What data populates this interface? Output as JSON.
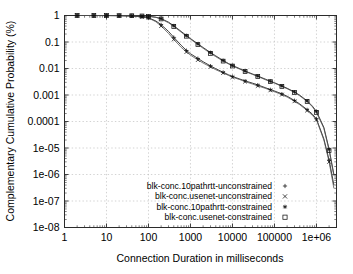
{
  "chart_data": {
    "type": "line",
    "title": "",
    "xlabel": "Connection Duration in milliseconds",
    "ylabel": "Complementary Cumulative Probability (%)",
    "xscale": "log",
    "yscale": "log",
    "xlim": [
      1,
      3000000
    ],
    "ylim": [
      1e-08,
      1
    ],
    "grid": true,
    "xticks": [
      1,
      10,
      100,
      1000,
      10000,
      100000,
      1000000
    ],
    "xticklabels": [
      "1",
      "10",
      "100",
      "1000",
      "10000",
      "100000",
      "1e+06"
    ],
    "yticks": [
      1,
      0.1,
      0.01,
      0.001,
      0.0001,
      1e-05,
      1e-06,
      1e-07,
      1e-08
    ],
    "yticklabels": [
      "1",
      "0.1",
      "0.01",
      "0.001",
      "0.0001",
      "1e-05",
      "1e-06",
      "1e-07",
      "1e-08"
    ],
    "legend_position": "lower center",
    "series": [
      {
        "name": "blk-conc.10pathrtt-unconstrained",
        "marker": "plus",
        "points": [
          [
            2,
            1
          ],
          [
            5,
            1
          ],
          [
            10,
            0.995
          ],
          [
            20,
            0.985
          ],
          [
            40,
            0.96
          ],
          [
            70,
            0.9
          ],
          [
            100,
            0.82
          ],
          [
            150,
            0.62
          ],
          [
            200,
            0.45
          ],
          [
            300,
            0.25
          ],
          [
            400,
            0.15
          ],
          [
            600,
            0.075
          ],
          [
            800,
            0.048
          ],
          [
            1000,
            0.036
          ],
          [
            1500,
            0.024
          ],
          [
            2000,
            0.018
          ],
          [
            3000,
            0.0125
          ],
          [
            4000,
            0.0098
          ],
          [
            6000,
            0.0072
          ],
          [
            8000,
            0.0058
          ],
          [
            10000,
            0.005
          ],
          [
            15000,
            0.004
          ],
          [
            20000,
            0.0034
          ],
          [
            30000,
            0.0028
          ],
          [
            40000,
            0.0024
          ],
          [
            60000,
            0.0019
          ],
          [
            80000,
            0.0016
          ],
          [
            100000,
            0.00142
          ],
          [
            150000,
            0.0011
          ],
          [
            200000,
            0.0009
          ],
          [
            300000,
            0.00062
          ],
          [
            400000,
            0.00046
          ],
          [
            600000,
            0.00028
          ],
          [
            800000,
            0.00019
          ],
          [
            1000000,
            0.000125
          ],
          [
            1500000,
            2.2e-05
          ],
          [
            2000000,
            3.5e-06
          ],
          [
            2600000,
            4e-07
          ]
        ]
      },
      {
        "name": "blk-conc.usenet-unconstrained",
        "marker": "cross",
        "points": [
          [
            2,
            1
          ],
          [
            5,
            1
          ],
          [
            10,
            0.995
          ],
          [
            20,
            0.985
          ],
          [
            40,
            0.955
          ],
          [
            70,
            0.885
          ],
          [
            100,
            0.8
          ],
          [
            150,
            0.58
          ],
          [
            200,
            0.4
          ],
          [
            300,
            0.21
          ],
          [
            400,
            0.125
          ],
          [
            600,
            0.063
          ],
          [
            800,
            0.042
          ],
          [
            1000,
            0.032
          ],
          [
            1500,
            0.021
          ],
          [
            2000,
            0.016
          ],
          [
            3000,
            0.0115
          ],
          [
            4000,
            0.009
          ],
          [
            6000,
            0.0068
          ],
          [
            8000,
            0.0055
          ],
          [
            10000,
            0.0047
          ],
          [
            15000,
            0.0038
          ],
          [
            20000,
            0.0032
          ],
          [
            30000,
            0.0026
          ],
          [
            40000,
            0.0022
          ],
          [
            60000,
            0.0018
          ],
          [
            80000,
            0.0015
          ],
          [
            100000,
            0.00133
          ],
          [
            150000,
            0.00103
          ],
          [
            200000,
            0.00084
          ],
          [
            300000,
            0.00058
          ],
          [
            400000,
            0.00043
          ],
          [
            600000,
            0.00026
          ],
          [
            800000,
            0.00017
          ],
          [
            1000000,
            0.000115
          ],
          [
            1500000,
            2e-05
          ],
          [
            2000000,
            3e-06
          ],
          [
            2600000,
            3e-07
          ]
        ]
      },
      {
        "name": "blk-conc.10pathrtt-constrained",
        "marker": "star",
        "points": [
          [
            2,
            1
          ],
          [
            5,
            1
          ],
          [
            10,
            0.998
          ],
          [
            20,
            0.993
          ],
          [
            40,
            0.985
          ],
          [
            70,
            0.965
          ],
          [
            100,
            0.94
          ],
          [
            150,
            0.86
          ],
          [
            200,
            0.76
          ],
          [
            300,
            0.56
          ],
          [
            400,
            0.41
          ],
          [
            600,
            0.25
          ],
          [
            800,
            0.175
          ],
          [
            1000,
            0.135
          ],
          [
            1500,
            0.085
          ],
          [
            2000,
            0.062
          ],
          [
            3000,
            0.04
          ],
          [
            4000,
            0.03
          ],
          [
            6000,
            0.02
          ],
          [
            8000,
            0.0155
          ],
          [
            10000,
            0.013
          ],
          [
            15000,
            0.0098
          ],
          [
            20000,
            0.008
          ],
          [
            30000,
            0.0062
          ],
          [
            40000,
            0.0052
          ],
          [
            60000,
            0.004
          ],
          [
            80000,
            0.0033
          ],
          [
            100000,
            0.0029
          ],
          [
            150000,
            0.0022
          ],
          [
            200000,
            0.0018
          ],
          [
            300000,
            0.0013
          ],
          [
            400000,
            0.00098
          ],
          [
            600000,
            0.0006
          ],
          [
            800000,
            0.00038
          ],
          [
            1000000,
            0.00024
          ],
          [
            1500000,
            6e-05
          ],
          [
            2000000,
            9e-06
          ],
          [
            2600000,
            1e-06
          ]
        ]
      },
      {
        "name": "blk-conc.usenet-constrained",
        "marker": "square",
        "points": [
          [
            2,
            1
          ],
          [
            5,
            1
          ],
          [
            10,
            0.998
          ],
          [
            20,
            0.992
          ],
          [
            40,
            0.983
          ],
          [
            70,
            0.962
          ],
          [
            100,
            0.935
          ],
          [
            150,
            0.85
          ],
          [
            200,
            0.74
          ],
          [
            300,
            0.53
          ],
          [
            400,
            0.385
          ],
          [
            600,
            0.235
          ],
          [
            800,
            0.165
          ],
          [
            1000,
            0.128
          ],
          [
            1500,
            0.08
          ],
          [
            2000,
            0.058
          ],
          [
            3000,
            0.037
          ],
          [
            4000,
            0.028
          ],
          [
            6000,
            0.019
          ],
          [
            8000,
            0.0148
          ],
          [
            10000,
            0.0124
          ],
          [
            15000,
            0.0094
          ],
          [
            20000,
            0.0077
          ],
          [
            30000,
            0.006
          ],
          [
            40000,
            0.005
          ],
          [
            60000,
            0.0038
          ],
          [
            80000,
            0.0032
          ],
          [
            100000,
            0.0028
          ],
          [
            150000,
            0.0021
          ],
          [
            200000,
            0.00172
          ],
          [
            300000,
            0.00124
          ],
          [
            400000,
            0.00093
          ],
          [
            600000,
            0.00057
          ],
          [
            800000,
            0.00036
          ],
          [
            1000000,
            0.00022
          ],
          [
            1500000,
            5.5e-05
          ],
          [
            2000000,
            8e-06
          ],
          [
            2600000,
            9e-07
          ]
        ]
      }
    ]
  },
  "legend": {
    "entries": [
      {
        "label": "blk-conc.10pathrtt-unconstrained",
        "marker": "plus"
      },
      {
        "label": "blk-conc.usenet-unconstrained",
        "marker": "cross"
      },
      {
        "label": "blk-conc.10pathrtt-constrained",
        "marker": "star"
      },
      {
        "label": "blk-conc.usenet-constrained",
        "marker": "square"
      }
    ]
  },
  "colors": {
    "axis": "#2b2b2b",
    "grid": "#b5b5b5",
    "curve": "#1a1a1a",
    "background": "#ffffff"
  }
}
